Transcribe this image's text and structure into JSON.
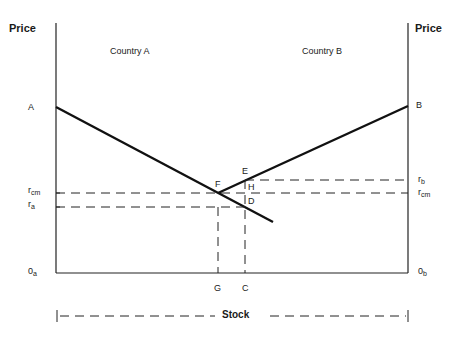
{
  "diagram": {
    "left_axis_label": "Price",
    "right_axis_label": "Price",
    "region_labels": {
      "left": "Country A",
      "right": "Country B"
    },
    "points": {
      "A": "A",
      "B": "B",
      "E": "E",
      "F": "F",
      "H": "H",
      "D": "D",
      "G": "G",
      "C": "C"
    },
    "left_ticks": {
      "r_cm": {
        "main": "r",
        "sub": "cm"
      },
      "r_a": {
        "main": "r",
        "sub": "a"
      },
      "origin": {
        "main": "0",
        "sub": "a"
      }
    },
    "right_ticks": {
      "r_b": {
        "main": "r",
        "sub": "b"
      },
      "r_cm": {
        "main": "r",
        "sub": "cm"
      },
      "origin": {
        "main": "0",
        "sub": "b"
      }
    },
    "stock_label": "Stock",
    "colors": {
      "line": "#1a1a1a",
      "background": "#ffffff"
    }
  }
}
